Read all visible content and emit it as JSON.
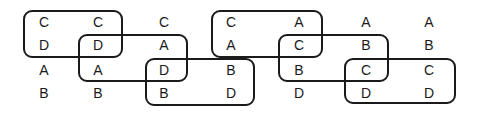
{
  "grid": {
    "columns": [
      [
        "C",
        "D",
        "A",
        "B"
      ],
      [
        "C",
        "D",
        "A",
        "B"
      ],
      [
        "C",
        "A",
        "D",
        "B"
      ],
      [
        "C",
        "A",
        "B",
        "D"
      ],
      [
        "A",
        "C",
        "B",
        "D"
      ],
      [
        "A",
        "B",
        "C",
        "D"
      ],
      [
        "A",
        "B",
        "C",
        "D"
      ]
    ]
  },
  "groups": [
    {
      "cols": [
        1,
        2
      ],
      "rows": [
        1,
        2
      ]
    },
    {
      "cols": [
        2,
        3
      ],
      "rows": [
        2,
        3
      ]
    },
    {
      "cols": [
        3,
        4
      ],
      "rows": [
        3,
        4
      ]
    },
    {
      "cols": [
        4,
        5
      ],
      "rows": [
        1,
        2
      ]
    },
    {
      "cols": [
        5,
        6
      ],
      "rows": [
        2,
        3
      ]
    },
    {
      "cols": [
        6,
        7
      ],
      "rows": [
        3,
        4
      ]
    }
  ]
}
